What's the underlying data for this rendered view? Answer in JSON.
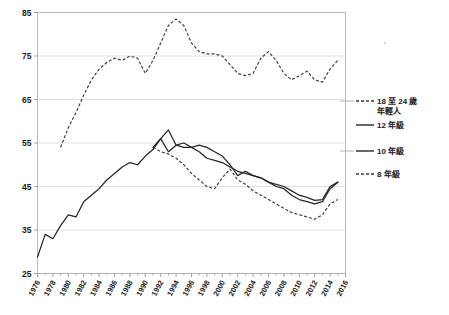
{
  "chart_data": {
    "type": "line",
    "title": "",
    "subtitle": "",
    "xlabel": "",
    "ylabel": "",
    "xlim": [
      1976,
      2016
    ],
    "ylim": [
      25,
      85
    ],
    "yticks": [
      25,
      35,
      45,
      55,
      65,
      75,
      85
    ],
    "xticks": [
      1976,
      1978,
      1980,
      1982,
      1984,
      1986,
      1988,
      1990,
      1992,
      1994,
      1996,
      1998,
      2000,
      2002,
      2004,
      2006,
      2008,
      2010,
      2012,
      2014,
      2016
    ],
    "grid": true,
    "legend_position": "right",
    "series": [
      {
        "name": "18 至 24 歲\n年輕人",
        "style": "dashed",
        "x": [
          1979,
          1980,
          1981,
          1982,
          1983,
          1984,
          1985,
          1986,
          1987,
          1988,
          1989,
          1990,
          1991,
          1992,
          1993,
          1994,
          1995,
          1996,
          1997,
          1998,
          1999,
          2000,
          2001,
          2002,
          2003,
          2004,
          2005,
          2006,
          2007,
          2008,
          2009,
          2010,
          2011,
          2012,
          2013,
          2014,
          2015
        ],
        "values": [
          54.0,
          58.5,
          62.0,
          66.0,
          69.5,
          72.0,
          73.5,
          74.5,
          74.0,
          75.0,
          74.5,
          71.0,
          74.0,
          78.0,
          82.0,
          83.5,
          82.0,
          78.0,
          76.0,
          75.5,
          75.5,
          75.0,
          73.0,
          71.0,
          70.5,
          71.0,
          74.5,
          76.0,
          74.0,
          71.0,
          69.5,
          70.5,
          71.5,
          69.5,
          69.0,
          72.0,
          74.0
        ]
      },
      {
        "name": "12 年級",
        "style": "solid",
        "x": [
          1976,
          1977,
          1978,
          1979,
          1980,
          1981,
          1982,
          1983,
          1984,
          1985,
          1986,
          1987,
          1988,
          1989,
          1990,
          1991,
          1992,
          1993,
          1994,
          1995,
          1996,
          1997,
          1998,
          1999,
          2000,
          2001,
          2002,
          2003,
          2004,
          2005,
          2006,
          2007,
          2008,
          2009,
          2010,
          2011,
          2012,
          2013,
          2014,
          2015
        ],
        "values": [
          28.8,
          34.0,
          33.0,
          36.0,
          38.5,
          38.0,
          41.5,
          43.0,
          44.5,
          46.5,
          48.0,
          49.5,
          50.5,
          50.0,
          52.0,
          53.5,
          56.0,
          53.0,
          54.5,
          55.0,
          54.0,
          53.0,
          51.5,
          51.0,
          50.5,
          49.5,
          48.5,
          48.0,
          47.5,
          47.0,
          46.0,
          45.5,
          45.0,
          44.0,
          43.0,
          42.5,
          41.8,
          42.0,
          45.0,
          46.0
        ]
      },
      {
        "name": "10 年級",
        "style": "solid",
        "x": [
          1991,
          1992,
          1993,
          1994,
          1995,
          1996,
          1997,
          1998,
          1999,
          2000,
          2001,
          2002,
          2003,
          2004,
          2005,
          2006,
          2007,
          2008,
          2009,
          2010,
          2011,
          2012,
          2013,
          2014,
          2015
        ],
        "values": [
          54.0,
          56.0,
          58.0,
          54.5,
          54.0,
          54.0,
          54.5,
          54.0,
          53.0,
          52.0,
          50.0,
          47.5,
          48.5,
          47.5,
          47.0,
          46.0,
          45.0,
          44.5,
          43.0,
          42.0,
          41.5,
          41.0,
          41.5,
          44.5,
          46.0
        ]
      },
      {
        "name": "8 年級",
        "style": "dashed",
        "x": [
          1991,
          1992,
          1993,
          1994,
          1995,
          1996,
          1997,
          1998,
          1999,
          2000,
          2001,
          2002,
          2003,
          2004,
          2005,
          2006,
          2007,
          2008,
          2009,
          2010,
          2011,
          2012,
          2013,
          2014,
          2015
        ],
        "values": [
          54.0,
          53.0,
          52.5,
          51.5,
          50.0,
          48.0,
          46.5,
          45.0,
          44.5,
          47.0,
          49.0,
          46.5,
          45.5,
          44.0,
          43.0,
          42.0,
          41.0,
          40.0,
          39.0,
          38.5,
          38.0,
          37.5,
          38.5,
          41.0,
          42.0
        ]
      }
    ]
  },
  "legend": {
    "entries": [
      {
        "label_line1": "18 至 24 歲",
        "label_line2": "年輕人",
        "style": "dashed"
      },
      {
        "label_line1": "12 年級",
        "label_line2": "",
        "style": "solid"
      },
      {
        "label_line1": "10 年級",
        "label_line2": "",
        "style": "solid"
      },
      {
        "label_line1": "8 年級",
        "label_line2": "",
        "style": "dashed"
      }
    ]
  },
  "axis": {
    "y_labels": [
      "85",
      "75",
      "65",
      "55",
      "45",
      "35",
      "25"
    ],
    "x_labels": [
      "1976",
      "1978",
      "1980",
      "1982",
      "1984",
      "1986",
      "1988",
      "1990",
      "1992",
      "1994",
      "1996",
      "1998",
      "2000",
      "2002",
      "2004",
      "2006",
      "2008",
      "2010",
      "2012",
      "2014",
      "2016"
    ]
  }
}
